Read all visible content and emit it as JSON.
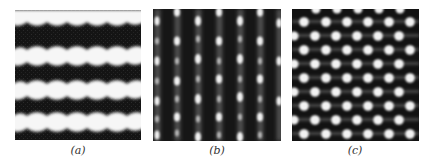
{
  "figure": {
    "panels": [
      {
        "id": "a",
        "caption": "(a)",
        "pattern": "horizontal wavy bright bands",
        "band_count": 4,
        "bumps_per_band": 5
      },
      {
        "id": "b",
        "caption": "(b)",
        "pattern": "vertical bright stripes with periodic spots",
        "stripe_count": 6
      },
      {
        "id": "c",
        "caption": "(c)",
        "pattern": "hexagonal lattice of bright dots",
        "rows": 9,
        "columns": 6
      }
    ],
    "colors": {
      "background": "#ffffff",
      "dark": "#151515",
      "bright": "#f4f4f4",
      "mid": "#8a8a8a"
    }
  }
}
